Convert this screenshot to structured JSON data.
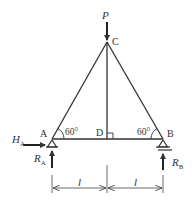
{
  "diagram": {
    "type": "truss",
    "nodes": {
      "A": {
        "label": "A"
      },
      "B": {
        "label": "B"
      },
      "C": {
        "label": "C"
      },
      "D": {
        "label": "D"
      }
    },
    "angles": {
      "at_A": "60°",
      "at_B": "60°"
    },
    "loads": {
      "P": {
        "label": "P",
        "direction": "down",
        "node": "C"
      }
    },
    "reactions": {
      "HA": {
        "symbol": "H",
        "subscript": "A",
        "direction": "right"
      },
      "RA": {
        "symbol": "R",
        "subscript": "A",
        "direction": "up"
      },
      "RB": {
        "symbol": "R",
        "subscript": "B",
        "direction": "up"
      }
    },
    "supports": {
      "A": "pin",
      "B": "roller"
    },
    "dimensions": [
      {
        "label": "l",
        "from": "A",
        "to": "D"
      },
      {
        "label": "l",
        "from": "D",
        "to": "B"
      }
    ],
    "colors": {
      "line": "#333333",
      "background": "#ffffff"
    }
  }
}
